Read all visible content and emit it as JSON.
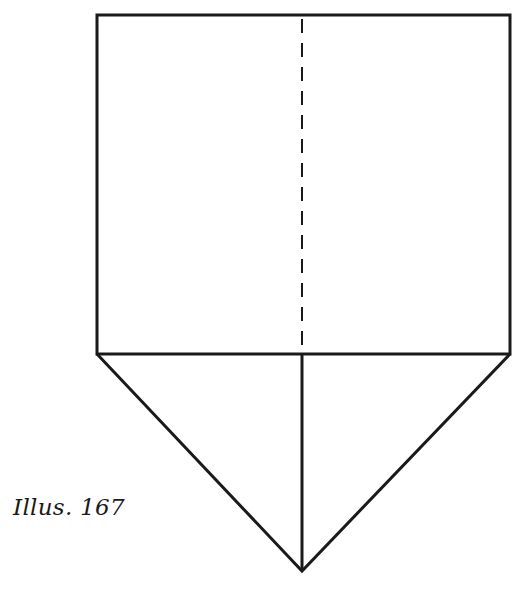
{
  "caption": "Illus. 167",
  "diagram": {
    "type": "fold-diagram",
    "stroke_color": "#1a1a1a",
    "square": {
      "x1": 97,
      "y1": 15,
      "x2": 510,
      "y2": 354
    },
    "fold_line": {
      "style": "dashed",
      "x": 302,
      "y1": 17,
      "y2": 352
    },
    "triangle": {
      "apex_x": 302,
      "apex_y": 571
    },
    "center_line": {
      "style": "solid",
      "x": 302,
      "y1": 354,
      "y2": 571
    }
  }
}
